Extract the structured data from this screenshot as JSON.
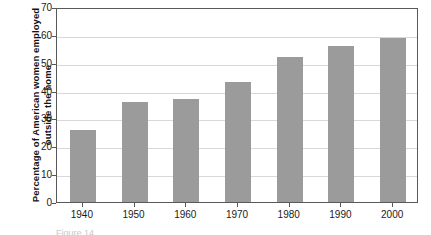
{
  "chart_data": {
    "type": "bar",
    "title": "",
    "subtitle": "",
    "xlabel": "",
    "ylabel": "Percentage of American women employed outside the home",
    "categories": [
      "1940",
      "1950",
      "1960",
      "1970",
      "1980",
      "1990",
      "2000"
    ],
    "values": [
      26,
      36,
      37,
      43,
      52,
      56,
      59
    ],
    "series": [
      {
        "name": "Percentage of American women employed outside the home",
        "values": [
          26,
          36,
          37,
          43,
          52,
          56,
          59
        ]
      }
    ],
    "ylim": [
      0,
      70
    ],
    "yticks": [
      0,
      10,
      20,
      30,
      40,
      50,
      60,
      70
    ],
    "ytick_labels": [
      "0",
      "10",
      "20",
      "30",
      "40",
      "50",
      "60",
      "70"
    ],
    "grid": "horizontal",
    "legend": "none",
    "bar_color": "#9b9b9b",
    "gridline_color": "#d8d8dc",
    "frame_color": "#58595b",
    "background_color": "#ffffff",
    "annotations": []
  },
  "caption": {
    "cropped_text": "Figure  14"
  }
}
